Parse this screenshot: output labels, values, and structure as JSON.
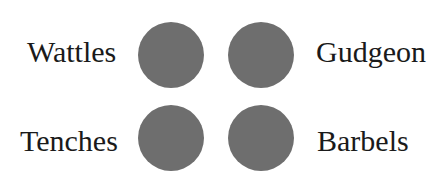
{
  "items": [
    {
      "label": "Wattles",
      "position": "top-left",
      "color": "#6e6e6e"
    },
    {
      "label": "Gudgeon",
      "position": "top-right",
      "color": "#6e6e6e"
    },
    {
      "label": "Tenches",
      "position": "bottom-left",
      "color": "#6e6e6e"
    },
    {
      "label": "Barbels",
      "position": "bottom-right",
      "color": "#6e6e6e"
    }
  ]
}
